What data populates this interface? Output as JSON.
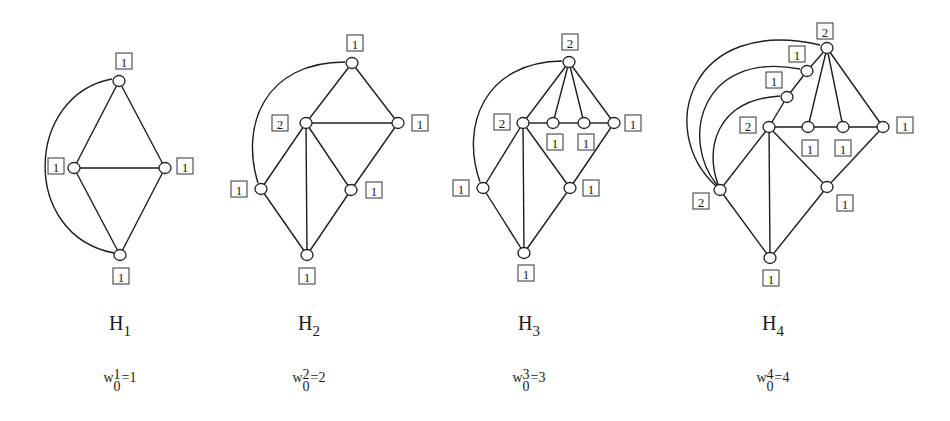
{
  "figure": {
    "graphs": [
      {
        "id": "H1",
        "caption": {
          "name": "H",
          "sub": "1"
        },
        "weight_caption": {
          "base": "w",
          "sup": "1",
          "sub": "0",
          "rest": "=1"
        },
        "caption_x": 120,
        "nodes": [
          {
            "x": 119,
            "y": 81,
            "w": "1",
            "lx": 124,
            "ly": 61
          },
          {
            "x": 74,
            "y": 168,
            "w": "1",
            "lx": 56,
            "ly": 166
          },
          {
            "x": 165,
            "y": 168,
            "w": "1",
            "lx": 185,
            "ly": 166
          },
          {
            "x": 120,
            "y": 255,
            "w": "1",
            "lx": 121,
            "ly": 276
          }
        ],
        "edges": [
          [
            0,
            1
          ],
          [
            0,
            2
          ],
          [
            1,
            2
          ],
          [
            1,
            3
          ],
          [
            2,
            3
          ]
        ],
        "arcs": [
          {
            "d": "M 112 79 C 25 95, 20 235, 114 253"
          }
        ]
      },
      {
        "id": "H2",
        "caption": {
          "name": "H",
          "sub": "2"
        },
        "weight_caption": {
          "base": "w",
          "sup": "2",
          "sub": "0",
          "rest": "=2"
        },
        "caption_x": 309,
        "nodes": [
          {
            "x": 352,
            "y": 63,
            "w": "1",
            "lx": 355,
            "ly": 43
          },
          {
            "x": 306,
            "y": 123,
            "w": "2",
            "lx": 280,
            "ly": 123
          },
          {
            "x": 398,
            "y": 123,
            "w": "1",
            "lx": 420,
            "ly": 123
          },
          {
            "x": 261,
            "y": 189,
            "w": "1",
            "lx": 239,
            "ly": 189
          },
          {
            "x": 351,
            "y": 190,
            "w": "1",
            "lx": 374,
            "ly": 190
          },
          {
            "x": 307,
            "y": 255,
            "w": "1",
            "lx": 307,
            "ly": 276
          }
        ],
        "edges": [
          [
            0,
            1
          ],
          [
            0,
            2
          ],
          [
            1,
            2
          ],
          [
            1,
            3
          ],
          [
            1,
            4
          ],
          [
            1,
            5
          ],
          [
            2,
            4
          ],
          [
            3,
            5
          ],
          [
            4,
            5
          ]
        ],
        "arcs": [
          {
            "d": "M 345 62 C 265 62, 240 125, 258 183"
          }
        ]
      },
      {
        "id": "H3",
        "caption": {
          "name": "H",
          "sub": "3"
        },
        "weight_caption": {
          "base": "w",
          "sup": "3",
          "sub": "0",
          "rest": "=3"
        },
        "caption_x": 529,
        "nodes": [
          {
            "x": 569,
            "y": 62,
            "w": "2",
            "lx": 570,
            "ly": 42
          },
          {
            "x": 523,
            "y": 123,
            "w": "2",
            "lx": 502,
            "ly": 122
          },
          {
            "x": 553,
            "y": 123,
            "w": "1",
            "lx": 555,
            "ly": 142
          },
          {
            "x": 584,
            "y": 123,
            "w": "1",
            "lx": 586,
            "ly": 142
          },
          {
            "x": 614,
            "y": 123,
            "w": "1",
            "lx": 633,
            "ly": 123
          },
          {
            "x": 483,
            "y": 188,
            "w": "1",
            "lx": 461,
            "ly": 188
          },
          {
            "x": 570,
            "y": 188,
            "w": "1",
            "lx": 591,
            "ly": 188
          },
          {
            "x": 524,
            "y": 253,
            "w": "1",
            "lx": 526,
            "ly": 273
          }
        ],
        "edges": [
          [
            0,
            1
          ],
          [
            0,
            2
          ],
          [
            0,
            3
          ],
          [
            0,
            4
          ],
          [
            1,
            2
          ],
          [
            2,
            3
          ],
          [
            3,
            4
          ],
          [
            1,
            5
          ],
          [
            1,
            6
          ],
          [
            1,
            7
          ],
          [
            4,
            6
          ],
          [
            5,
            7
          ],
          [
            6,
            7
          ]
        ],
        "arcs": [
          {
            "d": "M 562 61 C 485 62, 460 125, 480 182"
          }
        ]
      },
      {
        "id": "H4",
        "caption": {
          "name": "H",
          "sub": "4"
        },
        "weight_caption": {
          "base": "w",
          "sup": "4",
          "sub": "0",
          "rest": "=4"
        },
        "caption_x": 773,
        "nodes": [
          {
            "x": 827,
            "y": 48,
            "w": "2",
            "lx": 825,
            "ly": 31
          },
          {
            "x": 807,
            "y": 71,
            "w": "1",
            "lx": 797,
            "ly": 54
          },
          {
            "x": 787,
            "y": 97,
            "w": "1",
            "lx": 774,
            "ly": 80
          },
          {
            "x": 769,
            "y": 127,
            "w": "2",
            "lx": 748,
            "ly": 125
          },
          {
            "x": 808,
            "y": 127,
            "w": "1",
            "lx": 810,
            "ly": 148
          },
          {
            "x": 843,
            "y": 127,
            "w": "1",
            "lx": 843,
            "ly": 148
          },
          {
            "x": 883,
            "y": 127,
            "w": "1",
            "lx": 905,
            "ly": 125
          },
          {
            "x": 720,
            "y": 190,
            "w": "2",
            "lx": 701,
            "ly": 201
          },
          {
            "x": 827,
            "y": 187,
            "w": "1",
            "lx": 845,
            "ly": 203
          },
          {
            "x": 770,
            "y": 258,
            "w": "1",
            "lx": 771,
            "ly": 278
          }
        ],
        "edges": [
          [
            0,
            1
          ],
          [
            1,
            2
          ],
          [
            2,
            3
          ],
          [
            0,
            4
          ],
          [
            0,
            5
          ],
          [
            0,
            6
          ],
          [
            3,
            4
          ],
          [
            4,
            5
          ],
          [
            5,
            6
          ],
          [
            3,
            7
          ],
          [
            3,
            8
          ],
          [
            3,
            9
          ],
          [
            6,
            8
          ],
          [
            7,
            9
          ],
          [
            8,
            9
          ]
        ],
        "arcs": [
          {
            "d": "M 820 45 C 690 15, 655 130, 716 186"
          },
          {
            "d": "M 800 69 C 700 50, 680 140, 717 185"
          },
          {
            "d": "M 780 96 C 715 100, 705 150, 718 184"
          }
        ]
      }
    ]
  }
}
